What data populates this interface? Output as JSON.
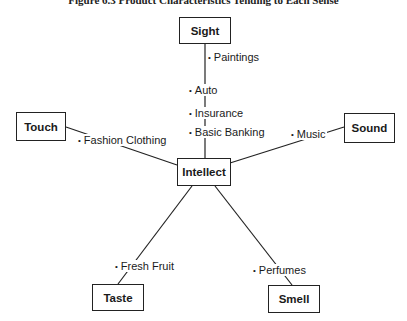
{
  "title": "Figure 6.3  Product Characteristics Tending to Each Sense",
  "center": {
    "label": "Intellect"
  },
  "senses": {
    "sight": {
      "label": "Sight",
      "items": [
        "Paintings",
        "Auto",
        "Insurance",
        "Basic Banking"
      ]
    },
    "touch": {
      "label": "Touch",
      "items": [
        "Fashion Clothing"
      ]
    },
    "sound": {
      "label": "Sound",
      "items": [
        "Music"
      ]
    },
    "taste": {
      "label": "Taste",
      "items": [
        "Fresh Fruit"
      ]
    },
    "smell": {
      "label": "Smell",
      "items": [
        "Perfumes"
      ]
    }
  },
  "bullet": "•"
}
